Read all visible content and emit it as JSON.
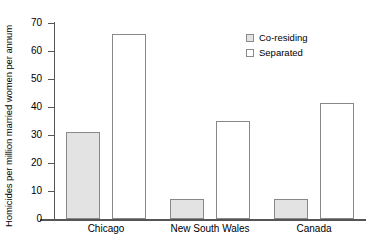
{
  "chart_data": {
    "type": "bar",
    "title": "",
    "xlabel": "",
    "ylabel": "Homicides per million married women per annum",
    "categories": [
      "Chicago",
      "New South Wales",
      "Canada"
    ],
    "series": [
      {
        "name": "Co-residing",
        "values": [
          31,
          7,
          7
        ],
        "fill": "#e3e3e3"
      },
      {
        "name": "Separated",
        "values": [
          66,
          35,
          41.5
        ],
        "fill": "#ffffff"
      }
    ],
    "ylim": [
      0,
      70
    ],
    "yticks": [
      0,
      10,
      20,
      30,
      40,
      50,
      60,
      70
    ],
    "ytick_labels": [
      "0",
      "10",
      "20",
      "30",
      "40",
      "50",
      "60",
      "70"
    ],
    "grid": false,
    "legend_position": "top-right"
  },
  "legend": {
    "items": [
      {
        "label": "Co-residing",
        "swatch": "gray-filled-square"
      },
      {
        "label": "Separated",
        "swatch": "white-empty-square"
      }
    ]
  },
  "axis": {
    "y_title": "Homicides per million married women per annum"
  },
  "colors": {
    "co_residing_fill": "#e3e3e3",
    "separated_fill": "#ffffff",
    "bar_stroke": "#888888",
    "axis": "#555555",
    "text": "#000000",
    "background": "#ffffff"
  }
}
